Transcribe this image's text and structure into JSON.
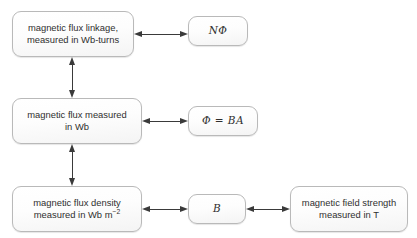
{
  "diagram": {
    "background_color": "#ffffff",
    "line_color": "#3a3a3a",
    "node_border_color": "#b9b9b9",
    "nodes": [
      {
        "id": "flux-linkage",
        "label": "magnetic flux linkage,\nmeasured in Wb-turns",
        "kind": "text"
      },
      {
        "id": "n-phi",
        "label": "NΦ",
        "kind": "symbol"
      },
      {
        "id": "magnetic-flux",
        "label": "magnetic flux measured\nin Wb",
        "kind": "text"
      },
      {
        "id": "phi-equals-ba",
        "label": "Φ = BA",
        "kind": "symbol"
      },
      {
        "id": "flux-density",
        "label_line1": "magnetic flux density",
        "label_line2_prefix": "measured in Wb m",
        "label_line2_sup": "−2",
        "kind": "text"
      },
      {
        "id": "b-symbol",
        "label": "B",
        "kind": "symbol"
      },
      {
        "id": "field-strength",
        "label": "magnetic field strength\nmeasured in T",
        "kind": "text"
      }
    ],
    "connectors": [
      {
        "id": "flux-linkage-to-n-phi",
        "orientation": "horizontal",
        "double_headed": true
      },
      {
        "id": "flux-linkage-to-magnetic-flux",
        "orientation": "vertical",
        "double_headed": true
      },
      {
        "id": "magnetic-flux-to-phi-equals-ba",
        "orientation": "horizontal",
        "double_headed": true
      },
      {
        "id": "magnetic-flux-to-flux-density",
        "orientation": "vertical",
        "double_headed": true
      },
      {
        "id": "flux-density-to-b",
        "orientation": "horizontal",
        "double_headed": true
      },
      {
        "id": "b-to-field-strength",
        "orientation": "horizontal",
        "double_headed": true
      }
    ],
    "scan_artifact_text": "· · · · · · · · · · · · · · · · · · · ·"
  }
}
